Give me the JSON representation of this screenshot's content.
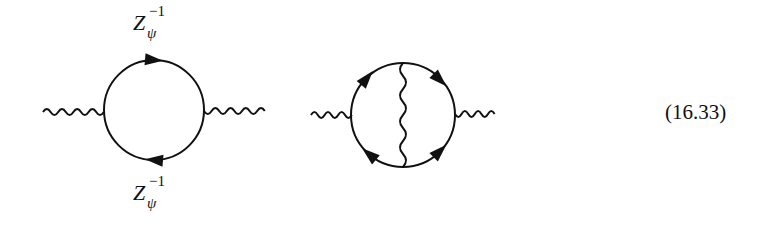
{
  "equation_number": "(16.33)",
  "diagrams": [
    {
      "name": "one-loop-photon-self-energy",
      "labels": {
        "top": {
          "base": "Z",
          "superscript": "−1",
          "subscript": "ψ"
        },
        "bottom": {
          "base": "Z",
          "superscript": "−1",
          "subscript": "ψ"
        }
      },
      "fermion_loop": {
        "cx": 154,
        "cy": 110,
        "r": 50
      },
      "external_photons": [
        {
          "x1": 43,
          "x2": 104,
          "y": 111
        },
        {
          "x1": 204,
          "x2": 265,
          "y": 111
        }
      ],
      "arrows": [
        {
          "position": "top",
          "direction": "right"
        },
        {
          "position": "bottom",
          "direction": "left"
        }
      ]
    },
    {
      "name": "two-loop-photon-self-energy",
      "fermion_loop": {
        "cx": 403,
        "cy": 115,
        "r": 52
      },
      "external_photons": [
        {
          "x1": 311,
          "x2": 352,
          "y": 114
        },
        {
          "x1": 455,
          "x2": 495,
          "y": 114
        }
      ],
      "internal_photon": {
        "x": 403,
        "y1": 63,
        "y2": 167
      },
      "arrows": [
        {
          "position": "upper-left",
          "direction": "up-right"
        },
        {
          "position": "upper-right",
          "direction": "down-right"
        },
        {
          "position": "lower-left",
          "direction": "up-left"
        },
        {
          "position": "lower-right",
          "direction": "up-right"
        }
      ]
    }
  ],
  "colors": {
    "line": "#111111",
    "background": "#ffffff"
  }
}
